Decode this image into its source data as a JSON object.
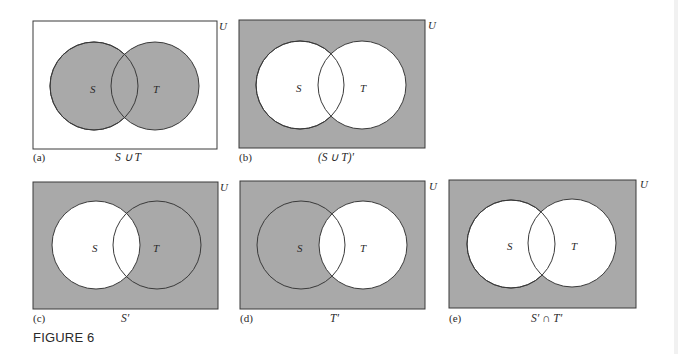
{
  "figure": {
    "title": "FIGURE 6",
    "colors": {
      "shade": "#a9a9a9",
      "unshaded": "#ffffff",
      "stroke": "#3a3a3a"
    },
    "universe_label": "U",
    "set_labels": {
      "left": "S",
      "right": "T"
    },
    "panels": [
      {
        "id": "(a)",
        "caption": "S ∪ T",
        "shaded_regions": [
          "S only",
          "S ∩ T",
          "T only"
        ],
        "background_shaded": false
      },
      {
        "id": "(b)",
        "caption": "(S ∪ T)′",
        "shaded_regions": [
          "outside"
        ],
        "background_shaded": true
      },
      {
        "id": "(c)",
        "caption": "S′",
        "shaded_regions": [
          "outside",
          "T only"
        ],
        "background_shaded": true
      },
      {
        "id": "(d)",
        "caption": "T′",
        "shaded_regions": [
          "outside",
          "S only"
        ],
        "background_shaded": true
      },
      {
        "id": "(e)",
        "caption": "S′ ∩ T′",
        "shaded_regions": [
          "outside"
        ],
        "background_shaded": true
      }
    ]
  }
}
